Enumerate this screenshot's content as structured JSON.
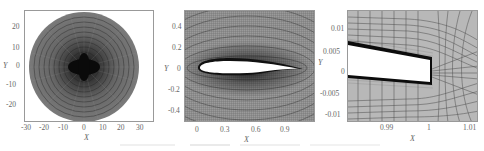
{
  "figure": {
    "panels": [
      {
        "id": "far-field-mesh",
        "xlabel": "X",
        "ylabel": "Y",
        "xticks": [
          "-30",
          "-20",
          "-10",
          "0",
          "10",
          "20",
          "30"
        ],
        "yticks": [
          "20",
          "10",
          "0",
          "-10",
          "-20"
        ],
        "xlim": [
          -35,
          38
        ],
        "ylim": [
          -29,
          29
        ]
      },
      {
        "id": "airfoil-mesh",
        "xlabel": "X",
        "ylabel": "Y",
        "xticks": [
          "0",
          "0.3",
          "0.6",
          "0.9"
        ],
        "yticks": [
          "0.4",
          "0.2",
          "0",
          "-0.2",
          "-0.4"
        ],
        "xlim": [
          -0.1,
          1.15
        ],
        "ylim": [
          -0.5,
          0.55
        ]
      },
      {
        "id": "trailing-edge-mesh",
        "xlabel": "X",
        "ylabel": "Y",
        "xticks": [
          "0.99",
          "1",
          "1.01"
        ],
        "yticks": [
          "0.01",
          "0.005",
          "0",
          "-0.005",
          "-0.01"
        ],
        "xlim": [
          0.9805,
          1.0115
        ],
        "ylim": [
          -0.012,
          0.013
        ]
      }
    ]
  }
}
